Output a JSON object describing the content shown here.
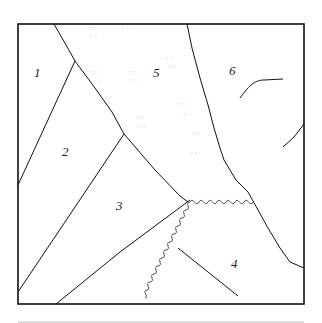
{
  "diagram": {
    "regions": [
      {
        "id": "1",
        "label": "1"
      },
      {
        "id": "2",
        "label": "2"
      },
      {
        "id": "3",
        "label": "3"
      },
      {
        "id": "4",
        "label": "4"
      },
      {
        "id": "5",
        "label": "5"
      },
      {
        "id": "6",
        "label": "6"
      }
    ],
    "features": {
      "stippled_region": "5",
      "coiled_boundary": "between 3 and 4",
      "stroke_color": "#111111",
      "stipple_color": "#999999",
      "bottom_rule_color": "#bbbbbb"
    }
  }
}
